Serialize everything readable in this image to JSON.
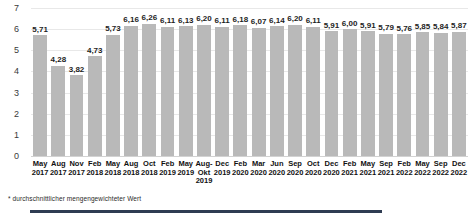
{
  "chart_data": {
    "type": "bar",
    "title": "",
    "xlabel": "",
    "ylabel": "",
    "ylim": [
      0,
      7
    ],
    "yticks": [
      0,
      1,
      2,
      3,
      4,
      5,
      6,
      7
    ],
    "grid": true,
    "legend": "none",
    "bar_color": "#b9b9b9",
    "categories": [
      "May 2017",
      "Aug 2017",
      "Nov 2017",
      "Feb 2018",
      "May 2018",
      "Aug 2018",
      "Oct 2018",
      "Feb 2019",
      "May 2019",
      "Aug-Okt 2019",
      "Dec 2019",
      "Feb 2020",
      "Mar 2020",
      "Jun 2020",
      "Sep 2020",
      "Oct 2020",
      "Dec 2020",
      "Feb 2021",
      "May 2021",
      "Sep 2021",
      "Feb 2022",
      "May 2022",
      "Sep 2022",
      "Dec 2022"
    ],
    "values": [
      5.71,
      4.28,
      3.82,
      4.73,
      5.73,
      6.16,
      6.26,
      6.11,
      6.13,
      6.2,
      6.11,
      6.18,
      6.07,
      6.14,
      6.2,
      6.11,
      5.91,
      6.0,
      5.91,
      5.79,
      5.76,
      5.85,
      5.84,
      5.87
    ],
    "value_labels": [
      "5,71",
      "4,28",
      "3,82",
      "4,73",
      "5,73",
      "6,16",
      "6,26",
      "6,11",
      "6,13",
      "6,20",
      "6,11",
      "6,18",
      "6,07",
      "6,14",
      "6,20",
      "6,11",
      "5,91",
      "6,00",
      "5,91",
      "5,79",
      "5,76",
      "5,85",
      "5,84",
      "5,87"
    ],
    "tick_labels": [
      {
        "month": "May",
        "year": "2017",
        "year2": ""
      },
      {
        "month": "Aug",
        "year": "2017",
        "year2": ""
      },
      {
        "month": "Nov",
        "year": "2017",
        "year2": ""
      },
      {
        "month": "Feb",
        "year": "2018",
        "year2": ""
      },
      {
        "month": "May",
        "year": "2018",
        "year2": ""
      },
      {
        "month": "Aug",
        "year": "2018",
        "year2": ""
      },
      {
        "month": "Oct",
        "year": "2018",
        "year2": ""
      },
      {
        "month": "Feb",
        "year": "2019",
        "year2": ""
      },
      {
        "month": "May",
        "year": "2019",
        "year2": ""
      },
      {
        "month": "Aug-",
        "year": "Okt",
        "year2": "2019"
      },
      {
        "month": "Dec",
        "year": "2019",
        "year2": ""
      },
      {
        "month": "Feb",
        "year": "2020",
        "year2": ""
      },
      {
        "month": "Mar",
        "year": "2020",
        "year2": ""
      },
      {
        "month": "Jun",
        "year": "2020",
        "year2": ""
      },
      {
        "month": "Sep",
        "year": "2020",
        "year2": ""
      },
      {
        "month": "Oct",
        "year": "2020",
        "year2": ""
      },
      {
        "month": "Dec",
        "year": "2020",
        "year2": ""
      },
      {
        "month": "Feb",
        "year": "2021",
        "year2": ""
      },
      {
        "month": "May",
        "year": "2021",
        "year2": ""
      },
      {
        "month": "Sep",
        "year": "2021",
        "year2": ""
      },
      {
        "month": "Feb",
        "year": "2022",
        "year2": ""
      },
      {
        "month": "May",
        "year": "2022",
        "year2": ""
      },
      {
        "month": "Sep",
        "year": "2022",
        "year2": ""
      },
      {
        "month": "Dec",
        "year": "2022",
        "year2": ""
      }
    ]
  },
  "footnote": {
    "text": "* durchschnittlicher mengengewichteter Wert"
  }
}
